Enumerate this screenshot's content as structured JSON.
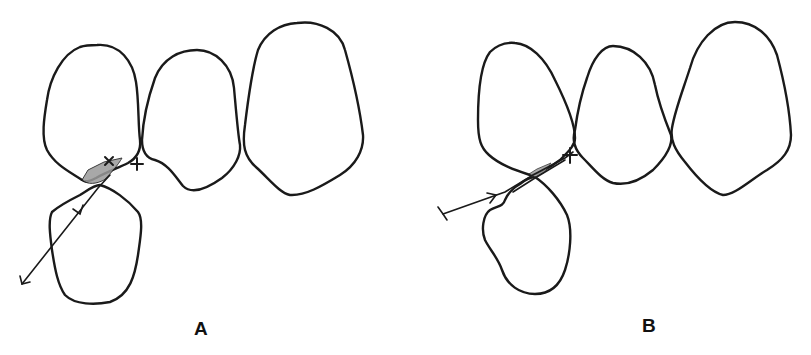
{
  "panels": [
    {
      "id": "A",
      "label": "A",
      "description": "Four cell outlines; ray enters from lower-left, crosses lower cell and passes through shaded junction region",
      "shaded_region": true,
      "markers": [
        "x",
        "+"
      ]
    },
    {
      "id": "B",
      "label": "B",
      "description": "Four cell outlines; ray enters from left, runs tangentially along junction to '+' marker",
      "shaded_region": true,
      "markers": [
        "+"
      ]
    }
  ],
  "colors": {
    "stroke": "#1a1a1a",
    "background": "#ffffff",
    "shading": "#888888"
  }
}
